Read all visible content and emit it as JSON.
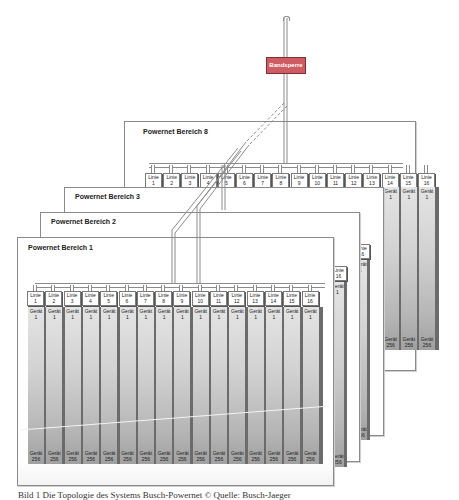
{
  "bandsperre": {
    "label": "Bandsperre",
    "color": "#cf5b63"
  },
  "areas": [
    {
      "id": "bereich-8",
      "title": "Powernet Bereich 8",
      "lines": [
        "1",
        "2",
        "3",
        "4",
        "5",
        "6",
        "7",
        "8",
        "9",
        "10",
        "11",
        "12",
        "13",
        "14",
        "15",
        "16"
      ]
    },
    {
      "id": "bereich-3",
      "title": "Powernet Bereich 3"
    },
    {
      "id": "bereich-2",
      "title": "Powernet Bereich 2"
    },
    {
      "id": "bereich-1",
      "title": "Powernet Bereich 1",
      "lines": [
        "1",
        "2",
        "3",
        "4",
        "5",
        "6",
        "7",
        "8",
        "9",
        "10",
        "11",
        "12",
        "13",
        "14",
        "15",
        "16"
      ]
    }
  ],
  "line_label": "Linie",
  "device_label": "Gerät",
  "device_first": "1",
  "device_last": "256",
  "line_16_label": "16",
  "caption": "Bild 1 Die Topologie des Systems Busch-Powernet © Quelle: Busch-Jaeger"
}
